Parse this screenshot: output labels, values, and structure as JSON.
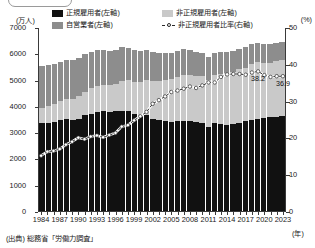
{
  "axes": {
    "left_unit": "(万人)",
    "right_unit": "(%)",
    "x_unit": "(年)",
    "left_ticks": [
      "7000",
      "6000",
      "5000",
      "4000",
      "3000",
      "2000",
      "1000",
      "0"
    ],
    "right_ticks": [
      "50",
      "40",
      "30",
      "20",
      "10",
      "0"
    ]
  },
  "legend": {
    "items": [
      {
        "label": "正規雇用者(左軸)",
        "swatch": "black-square-icon",
        "color": "#111111"
      },
      {
        "label": "非正規雇用者(左軸)",
        "swatch": "light-gray-square-icon",
        "color": "#c9c9c9"
      },
      {
        "label": "自営業者(左軸)",
        "swatch": "mid-gray-square-icon",
        "color": "#8d8d8d"
      },
      {
        "label": "非正規雇用者比率(右軸)",
        "swatch": "dashed-line-marker-icon",
        "color": "#2a2a2a"
      }
    ]
  },
  "source": "(出典) 総務省「労働力調査」",
  "annotations": [
    {
      "text": "38.2",
      "year": 2019
    },
    {
      "text": "36.9",
      "year": 2023
    }
  ],
  "chart_data": {
    "type": "bar",
    "title": "",
    "xlabel": "(年)",
    "ylabel": "(万人)",
    "y2label": "(%)",
    "ylim": [
      0,
      7000
    ],
    "y2lim": [
      0,
      50
    ],
    "grid": false,
    "legend_position": "top",
    "categories": [
      1984,
      1985,
      1986,
      1987,
      1988,
      1989,
      1990,
      1991,
      1992,
      1993,
      1994,
      1995,
      1996,
      1997,
      1998,
      1999,
      2000,
      2001,
      2002,
      2003,
      2004,
      2005,
      2006,
      2007,
      2008,
      2009,
      2010,
      2011,
      2012,
      2013,
      2014,
      2015,
      2016,
      2017,
      2018,
      2019,
      2020,
      2021,
      2022,
      2023
    ],
    "series": [
      {
        "name": "正規雇用者(左軸)",
        "axis": "left",
        "color": "#111111",
        "values": [
          3333,
          3343,
          3383,
          3456,
          3497,
          3452,
          3488,
          3639,
          3705,
          3756,
          3805,
          3779,
          3800,
          3812,
          3794,
          3688,
          3630,
          3640,
          3489,
          3444,
          3410,
          3375,
          3415,
          3441,
          3410,
          3395,
          3355,
          3185,
          3345,
          3302,
          3288,
          3317,
          3367,
          3423,
          3476,
          3494,
          3539,
          3565,
          3588,
          3615
        ],
        "note": "Regular employees, 10,000 persons"
      },
      {
        "name": "非正規雇用者(左軸)",
        "axis": "left",
        "color": "#c9c9c9",
        "values": [
          604,
          655,
          673,
          711,
          760,
          817,
          881,
          897,
          958,
          986,
          971,
          1001,
          1043,
          1152,
          1173,
          1225,
          1273,
          1360,
          1451,
          1504,
          1564,
          1634,
          1678,
          1735,
          1765,
          1727,
          1763,
          1812,
          1816,
          1910,
          1967,
          1986,
          2023,
          2036,
          2120,
          2165,
          2090,
          2064,
          2101,
          2124
        ],
        "note": "Non-regular employees, 10,000 persons"
      },
      {
        "name": "自営業者(左軸)",
        "axis": "left",
        "color": "#8d8d8d",
        "values": [
          1580,
          1560,
          1540,
          1520,
          1490,
          1470,
          1450,
          1430,
          1400,
          1370,
          1340,
          1310,
          1280,
          1260,
          1230,
          1200,
          1170,
          1140,
          1110,
          1080,
          1050,
          1020,
          990,
          970,
          940,
          910,
          890,
          860,
          840,
          820,
          800,
          790,
          780,
          770,
          760,
          750,
          740,
          730,
          720,
          710
        ],
        "note": "Self-employed, 10,000 persons"
      }
    ],
    "line_series": {
      "name": "非正規雇用者比率(右軸)",
      "axis": "right",
      "color": "#2a2a2a",
      "style": "dashed",
      "marker": "circle-white",
      "values": [
        15.3,
        16.4,
        16.6,
        17.1,
        18.3,
        19.1,
        20.2,
        19.8,
        20.5,
        20.8,
        20.3,
        20.9,
        21.5,
        23.2,
        23.6,
        24.9,
        26.0,
        27.2,
        29.4,
        30.4,
        31.4,
        32.6,
        33.0,
        33.5,
        34.1,
        33.7,
        34.4,
        35.2,
        35.2,
        36.7,
        37.4,
        37.5,
        37.5,
        37.3,
        37.9,
        38.2,
        37.2,
        36.7,
        36.9,
        36.9
      ]
    }
  }
}
